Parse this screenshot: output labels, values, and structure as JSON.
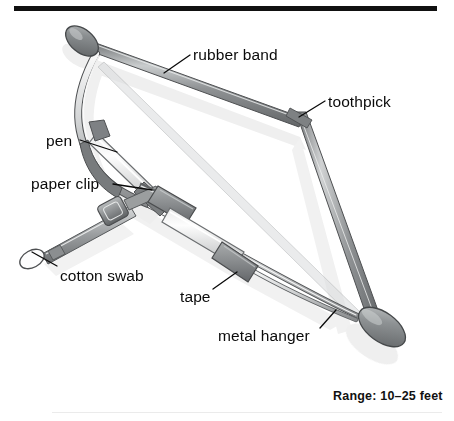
{
  "figure": {
    "type": "labeled-illustration",
    "background_color": "#ffffff",
    "ink_color": "#0a0a0a",
    "rules": {
      "top_rule_color": "#111111",
      "bottom_rule_color": "#ebebeb"
    },
    "palette": {
      "metal_dark": "#6e7173",
      "metal_mid": "#9a9d9f",
      "metal_light": "#d6d8d9",
      "highlight": "#f2f3f3",
      "outline": "#4a4c4e",
      "shadow": "#dcdcdc",
      "tape_grey": "#8e9193",
      "barrel_white": "#fbfbfb"
    },
    "callouts": [
      {
        "id": "rubber-band",
        "label": "rubber band",
        "text_x": 193,
        "text_y": 47,
        "leader": {
          "x1": 190,
          "y1": 55,
          "x2": 164,
          "y2": 73
        }
      },
      {
        "id": "toothpick",
        "label": "toothpick",
        "text_x": 328,
        "text_y": 94,
        "leader": {
          "x1": 325,
          "y1": 101,
          "x2": 299,
          "y2": 117
        }
      },
      {
        "id": "pen",
        "label": "pen",
        "text_x": 46,
        "text_y": 133,
        "leader": {
          "x1": 80,
          "y1": 140,
          "x2": 117,
          "y2": 152
        }
      },
      {
        "id": "paper-clip",
        "label": "paper clip",
        "text_x": 31,
        "text_y": 176,
        "leader": {
          "x1": 113,
          "y1": 184,
          "x2": 152,
          "y2": 190
        }
      },
      {
        "id": "cotton-swab",
        "label": "cotton swab",
        "text_x": 60,
        "text_y": 268,
        "leader": {
          "x1": 57,
          "y1": 266,
          "x2": 32,
          "y2": 252
        }
      },
      {
        "id": "tape",
        "label": "tape",
        "text_x": 180,
        "text_y": 289,
        "leader": {
          "x1": 213,
          "y1": 289,
          "x2": 237,
          "y2": 272
        }
      },
      {
        "id": "metal-hanger",
        "label": "metal hanger",
        "text_x": 218,
        "text_y": 328,
        "leader": {
          "x1": 320,
          "y1": 328,
          "x2": 336,
          "y2": 310
        }
      }
    ],
    "caption": {
      "range_label": "Range: 10–25 feet"
    }
  }
}
